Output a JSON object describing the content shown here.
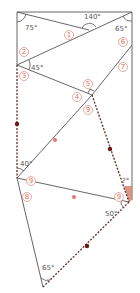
{
  "colors": {
    "line": "#555555",
    "dashed_segment": "#6b3a35",
    "dark_dot": "#6b1a14",
    "light_dot": "#e8776b",
    "label_circle": "#e0857a",
    "wedge_fill": "#d9826f"
  },
  "angles": {
    "top_left": "75°",
    "top_mid": "140°",
    "top_right": "65°",
    "left_mid": "45°",
    "left_lower": "40°",
    "right_lower_small": "?°",
    "right_bottom": "50°",
    "bottom": "65°"
  },
  "labels": {
    "n1": "1",
    "n2": "2",
    "n3": "3",
    "n4": "4",
    "n5": "5",
    "n6": "6",
    "n7": "7",
    "n8": "8",
    "n9a": "9",
    "n9b": "9",
    "n9c": "9"
  }
}
